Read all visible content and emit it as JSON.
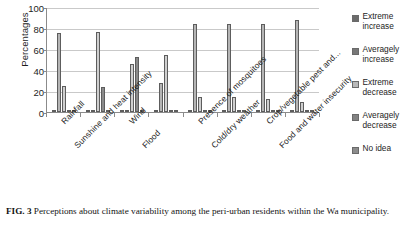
{
  "figure": {
    "caption_label": "FIG. 3",
    "caption_text": "Perceptions about climate variability among the peri-urban residents within the Wa municipality."
  },
  "chart_data": {
    "type": "bar",
    "title": "",
    "xlabel": "",
    "ylabel": "Percentages",
    "ylim": [
      0,
      100
    ],
    "yticks": [
      0,
      20,
      40,
      60,
      80,
      100
    ],
    "grid": true,
    "legend_position": "right",
    "categories": [
      "Rainfall",
      "Sunshine and heat intensity",
      "Wind",
      "Flood",
      "Presence of mosquitoes",
      "Cold/dry weather",
      "Crop/vegetable pest and...",
      "Food and water insecurity"
    ],
    "series": [
      {
        "name": "Extreme increase",
        "color": "#6e6e6e",
        "values": [
          1.5,
          1.5,
          1.0,
          1.0,
          1.5,
          1.0,
          1.0,
          1.0
        ]
      },
      {
        "name": "Averagely increase",
        "color": "#b5b5b5",
        "values": [
          75,
          0.8,
          0.8,
          28,
          84,
          84,
          84,
          88
        ]
      },
      {
        "name": "Extreme decrease",
        "color": "#cfcfcf",
        "values": [
          25,
          76,
          46,
          54,
          14,
          14,
          12,
          10
        ]
      },
      {
        "name": "Averagely decrease",
        "color": "#8a8a8a",
        "values": [
          1.2,
          24,
          52,
          1.2,
          1.2,
          1.2,
          1.2,
          1.2
        ]
      },
      {
        "name": "No idea",
        "color": "#9e9e9e",
        "values": [
          1.0,
          1.0,
          1.0,
          1.0,
          1.0,
          1.0,
          1.0,
          1.0
        ]
      }
    ]
  },
  "legend": {
    "items": [
      {
        "label_line1": "Extreme",
        "label_line2": "increase",
        "color": "#6b6b6b"
      },
      {
        "label_line1": "Averagely",
        "label_line2": "increase",
        "color": "#777777"
      },
      {
        "label_line1": "Extreme",
        "label_line2": "decrease",
        "color": "#b9b9b9"
      },
      {
        "label_line1": "Averagely",
        "label_line2": "decrease",
        "color": "#828282"
      },
      {
        "label_line1": "No idea",
        "label_line2": "",
        "color": "#8c8c8c"
      }
    ]
  }
}
